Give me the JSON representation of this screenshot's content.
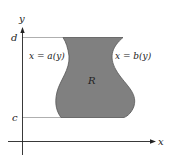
{
  "diagram": {
    "axes": {
      "x_label": "x",
      "y_label": "y"
    },
    "y_ticks": {
      "top_label": "d",
      "bottom_label": "c"
    },
    "curves": {
      "left_label": "x = a(y)",
      "right_label": "x = b(y)"
    },
    "region": {
      "label": "R",
      "fill_color": "#808080",
      "stroke_color": "#555555"
    },
    "guide_line_color": "#9a9a9a",
    "axis_color": "#222222"
  }
}
